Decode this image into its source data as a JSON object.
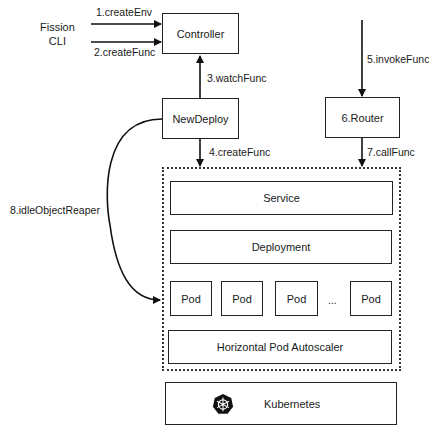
{
  "actors": {
    "fission_cli": [
      "Fission",
      "CLI"
    ]
  },
  "nodes": {
    "controller": "Controller",
    "newdeploy": "NewDeploy",
    "router": "6.Router",
    "service": "Service",
    "deployment": "Deployment",
    "pods": [
      "Pod",
      "Pod",
      "Pod",
      "Pod"
    ],
    "pods_ellipsis": "...",
    "hpa": "Horizontal Pod Autoscaler",
    "kubernetes": "Kubernetes"
  },
  "edges": {
    "e1": "1.createEnv",
    "e2": "2.createFunc",
    "e3": "3.watchFunc",
    "e4": "4.createFunc",
    "e5": "5.invokeFunc",
    "e7": "7.callFunc",
    "e8": "8.idleObjectReaper"
  },
  "icons": {
    "kubernetes": "kubernetes-helm-wheel-icon"
  },
  "colors": {
    "stroke": "#222222",
    "background": "#ffffff"
  }
}
